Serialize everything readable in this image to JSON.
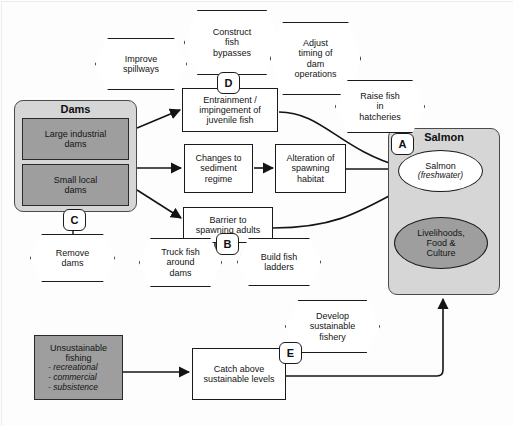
{
  "diagram": {
    "groups": [
      {
        "id": "dams",
        "label": "Dams",
        "children": [
          {
            "id": "large-industrial-dams",
            "label": "Large industrial\ndams"
          },
          {
            "id": "small-local-dams",
            "label": "Small local\ndams"
          }
        ]
      },
      {
        "id": "salmon",
        "label": "Salmon",
        "children": [
          {
            "id": "salmon-freshwater",
            "label": "Salmon",
            "sublabel": "(freshwater)"
          },
          {
            "id": "livelihoods",
            "label": "Livelihoods,\nFood &\nCulture"
          }
        ]
      }
    ],
    "threats": [
      {
        "id": "unsustainable-fishing",
        "label": "Unsustainable\nfishing",
        "bullets": [
          "- recreational",
          "- commercial",
          "- subsistence"
        ]
      }
    ],
    "stresses": [
      {
        "id": "entrainment",
        "label": "Entrainment /\nimpingement of\njuvenile fish"
      },
      {
        "id": "sediment-regime",
        "label": "Changes to\nsediment\nregime"
      },
      {
        "id": "spawning-habitat",
        "label": "Alteration of\nspawning\nhabitat"
      },
      {
        "id": "barrier-adults",
        "label": "Barrier to\nspawning adults"
      },
      {
        "id": "catch-above",
        "label": "Catch above\nsustainable levels"
      }
    ],
    "strategies": [
      {
        "id": "improve-spillways",
        "label": "Improve\nspillways"
      },
      {
        "id": "construct-fish-bypasses",
        "label": "Construct\nfish\nbypasses"
      },
      {
        "id": "adjust-timing",
        "label": "Adjust\ntiming of\ndam\noperations"
      },
      {
        "id": "raise-fish-hatcheries",
        "label": "Raise fish\nin\nhatcheries"
      },
      {
        "id": "remove-dams",
        "label": "Remove\ndams"
      },
      {
        "id": "truck-fish",
        "label": "Truck fish\naround\ndams"
      },
      {
        "id": "build-fish-ladders",
        "label": "Build fish\nladders"
      },
      {
        "id": "develop-sustainable-fishery",
        "label": "Develop\nsustainable\nfishery"
      }
    ],
    "markers": [
      {
        "id": "marker-a",
        "label": "A"
      },
      {
        "id": "marker-b",
        "label": "B"
      },
      {
        "id": "marker-c",
        "label": "C"
      },
      {
        "id": "marker-d",
        "label": "D"
      },
      {
        "id": "marker-e",
        "label": "E"
      }
    ],
    "colors": {
      "group_fill": "#d6d6d6",
      "shaded_fill": "#9e9e9e",
      "node_fill": "#ffffff",
      "stroke": "#1a1a1a"
    }
  }
}
